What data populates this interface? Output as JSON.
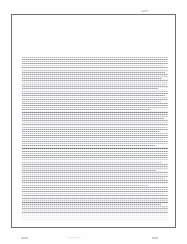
{
  "document": {
    "kind": "scanned-page-thumbnail",
    "page_label": "",
    "visible_text": "",
    "legibility": "illegible",
    "sheet": {
      "border_color": "#6e6e78",
      "paper_color": "#ffffff",
      "background_color": "#fefefe"
    },
    "text_block": {
      "ink_color": "#8d8d95",
      "alignment": "justified",
      "line_count": 74,
      "paragraphs": [
        {
          "name": "paragraph-1",
          "lines": [
            {
              "tone": "light",
              "width": 100
            },
            {
              "tone": "normal",
              "width": 100
            },
            {
              "tone": "light",
              "width": 99
            },
            {
              "tone": "normal",
              "width": 100
            },
            {
              "tone": "faint",
              "width": 97
            },
            {
              "tone": "normal",
              "width": 100
            },
            {
              "tone": "light",
              "width": 100
            },
            {
              "tone": "normal",
              "width": 98
            },
            {
              "tone": "normal",
              "width": 100
            },
            {
              "tone": "light",
              "width": 100
            },
            {
              "tone": "normal",
              "width": 96
            },
            {
              "tone": "normal",
              "width": 100
            },
            {
              "tone": "faint",
              "width": 100
            },
            {
              "tone": "light",
              "width": 99
            },
            {
              "tone": "normal",
              "width": 100
            },
            {
              "tone": "normal",
              "width": 93
            },
            {
              "tone": "light",
              "width": 100
            },
            {
              "tone": "normal",
              "width": 100
            },
            {
              "tone": "normal",
              "width": 98
            },
            {
              "tone": "faint",
              "width": 100
            },
            {
              "tone": "normal",
              "width": 100
            },
            {
              "tone": "light",
              "width": 95
            },
            {
              "tone": "normal",
              "width": 100
            },
            {
              "tone": "normal",
              "width": 100
            },
            {
              "tone": "light",
              "width": 100
            },
            {
              "tone": "normal",
              "width": 88
            }
          ]
        },
        {
          "name": "paragraph-2",
          "lines": [
            {
              "tone": "dark",
              "width": 100
            },
            {
              "tone": "normal",
              "width": 100
            },
            {
              "tone": "light",
              "width": 100
            },
            {
              "tone": "normal",
              "width": 97
            },
            {
              "tone": "normal",
              "width": 100
            },
            {
              "tone": "faint",
              "width": 100
            },
            {
              "tone": "normal",
              "width": 100
            },
            {
              "tone": "light",
              "width": 99
            },
            {
              "tone": "normal",
              "width": 100
            },
            {
              "tone": "normal",
              "width": 94
            },
            {
              "tone": "light",
              "width": 100
            },
            {
              "tone": "normal",
              "width": 100
            },
            {
              "tone": "normal",
              "width": 100
            },
            {
              "tone": "faint",
              "width": 98
            },
            {
              "tone": "normal",
              "width": 100
            },
            {
              "tone": "light",
              "width": 100
            },
            {
              "tone": "normal",
              "width": 91
            }
          ]
        },
        {
          "name": "paragraph-3",
          "lines": [
            {
              "tone": "rule",
              "width": 100
            },
            {
              "tone": "normal",
              "width": 100
            },
            {
              "tone": "light",
              "width": 100
            },
            {
              "tone": "normal",
              "width": 99
            },
            {
              "tone": "normal",
              "width": 100
            },
            {
              "tone": "faint",
              "width": 100
            },
            {
              "tone": "light",
              "width": 96
            },
            {
              "tone": "normal",
              "width": 100
            },
            {
              "tone": "normal",
              "width": 100
            },
            {
              "tone": "light",
              "width": 100
            },
            {
              "tone": "normal",
              "width": 92
            },
            {
              "tone": "normal",
              "width": 100
            },
            {
              "tone": "faint",
              "width": 100
            },
            {
              "tone": "normal",
              "width": 100
            },
            {
              "tone": "light",
              "width": 98
            },
            {
              "tone": "normal",
              "width": 100
            },
            {
              "tone": "normal",
              "width": 100
            },
            {
              "tone": "light",
              "width": 86
            }
          ]
        },
        {
          "name": "paragraph-4",
          "lines": [
            {
              "tone": "normal",
              "width": 100
            },
            {
              "tone": "light",
              "width": 100
            },
            {
              "tone": "normal",
              "width": 100
            },
            {
              "tone": "faint",
              "width": 97
            },
            {
              "tone": "normal",
              "width": 100
            },
            {
              "tone": "normal",
              "width": 100
            },
            {
              "tone": "light",
              "width": 100
            },
            {
              "tone": "dark",
              "width": 100
            },
            {
              "tone": "normal",
              "width": 95
            },
            {
              "tone": "light",
              "width": 100
            },
            {
              "tone": "normal",
              "width": 100
            },
            {
              "tone": "faint",
              "width": 100
            },
            {
              "tone": "normal",
              "width": 100
            }
          ]
        }
      ]
    },
    "artifacts": [
      {
        "name": "artifact-top-mark",
        "description": "faint smudge above page edge"
      },
      {
        "name": "artifact-bottom-left-mark",
        "description": "faint smudge below page edge"
      },
      {
        "name": "artifact-bottom-mid-mark",
        "description": "faint smudge below page edge"
      },
      {
        "name": "artifact-bottom-right-mark",
        "description": "faint smudge below page edge"
      }
    ]
  }
}
